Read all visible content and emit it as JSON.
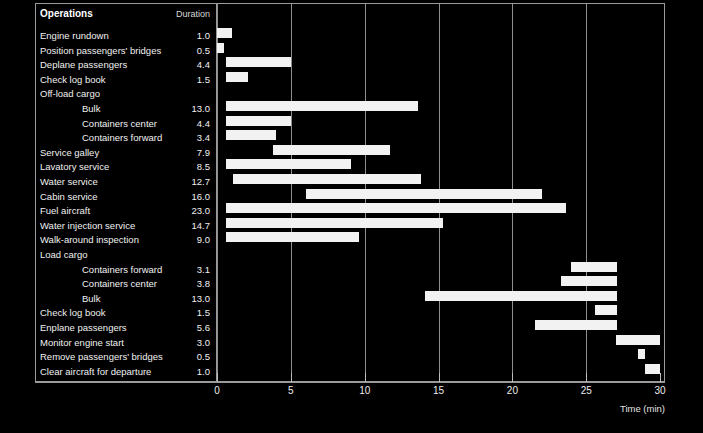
{
  "chart_data": {
    "type": "bar",
    "subtype": "gantt",
    "title": "",
    "xlabel": "Time (min)",
    "ylabel": "",
    "xlim": [
      0,
      30
    ],
    "xticks": [
      0,
      5,
      10,
      15,
      20,
      25,
      30
    ],
    "grid": "vertical",
    "legend": "none",
    "columns": [
      "Operations",
      "Duration"
    ],
    "bar_color": "#f2f2f2",
    "background_color": "#000000",
    "frame_color": "#9a9a9a",
    "tasks": [
      {
        "label": "Engine rundown",
        "indent": 0,
        "duration": "1.0",
        "start": 0.0,
        "length": 1.0,
        "has_bar": true
      },
      {
        "label": "Position passengers' bridges",
        "indent": 0,
        "duration": "0.5",
        "start": 0.0,
        "length": 0.5,
        "has_bar": true
      },
      {
        "label": "Deplane passengers",
        "indent": 0,
        "duration": "4.4",
        "start": 0.6,
        "length": 4.4,
        "has_bar": true
      },
      {
        "label": "Check log book",
        "indent": 0,
        "duration": "1.5",
        "start": 0.6,
        "length": 1.5,
        "has_bar": true
      },
      {
        "label": "Off-load cargo",
        "indent": 0,
        "duration": "",
        "start": 0.0,
        "length": 0.0,
        "has_bar": false
      },
      {
        "label": "Bulk",
        "indent": 1,
        "duration": "13.0",
        "start": 0.6,
        "length": 13.0,
        "has_bar": true
      },
      {
        "label": "Containers center",
        "indent": 1,
        "duration": "4.4",
        "start": 0.6,
        "length": 4.4,
        "has_bar": true
      },
      {
        "label": "Containers forward",
        "indent": 1,
        "duration": "3.4",
        "start": 0.6,
        "length": 3.4,
        "has_bar": true
      },
      {
        "label": "Service galley",
        "indent": 0,
        "duration": "7.9",
        "start": 3.8,
        "length": 7.9,
        "has_bar": true
      },
      {
        "label": "Lavatory service",
        "indent": 0,
        "duration": "8.5",
        "start": 0.6,
        "length": 8.5,
        "has_bar": true
      },
      {
        "label": "Water service",
        "indent": 0,
        "duration": "12.7",
        "start": 1.1,
        "length": 12.7,
        "has_bar": true
      },
      {
        "label": "Cabin service",
        "indent": 0,
        "duration": "16.0",
        "start": 6.0,
        "length": 16.0,
        "has_bar": true
      },
      {
        "label": "Fuel aircraft",
        "indent": 0,
        "duration": "23.0",
        "start": 0.6,
        "length": 23.0,
        "has_bar": true
      },
      {
        "label": "Water injection service",
        "indent": 0,
        "duration": "14.7",
        "start": 0.6,
        "length": 14.7,
        "has_bar": true
      },
      {
        "label": "Walk-around inspection",
        "indent": 0,
        "duration": "9.0",
        "start": 0.6,
        "length": 9.0,
        "has_bar": true
      },
      {
        "label": "Load cargo",
        "indent": 0,
        "duration": "",
        "start": 0.0,
        "length": 0.0,
        "has_bar": false
      },
      {
        "label": "Containers forward",
        "indent": 1,
        "duration": "3.1",
        "start": 24.0,
        "length": 3.1,
        "has_bar": true
      },
      {
        "label": "Containers center",
        "indent": 1,
        "duration": "3.8",
        "start": 23.3,
        "length": 3.8,
        "has_bar": true
      },
      {
        "label": "Bulk",
        "indent": 1,
        "duration": "13.0",
        "start": 14.1,
        "length": 13.0,
        "has_bar": true
      },
      {
        "label": "Check log book",
        "indent": 0,
        "duration": "1.5",
        "start": 25.6,
        "length": 1.5,
        "has_bar": true
      },
      {
        "label": "Enplane passengers",
        "indent": 0,
        "duration": "5.6",
        "start": 21.5,
        "length": 5.6,
        "has_bar": true
      },
      {
        "label": "Monitor engine start",
        "indent": 0,
        "duration": "3.0",
        "start": 27.0,
        "length": 3.0,
        "has_bar": true
      },
      {
        "label": "Remove passengers' bridges",
        "indent": 0,
        "duration": "0.5",
        "start": 28.5,
        "length": 0.5,
        "has_bar": true
      },
      {
        "label": "Clear aircraft for departure",
        "indent": 0,
        "duration": "1.0",
        "start": 29.0,
        "length": 1.0,
        "has_bar": true
      }
    ]
  },
  "header": {
    "operations_label": "Operations",
    "duration_label": "Duration"
  },
  "axis": {
    "title": "Time (min)",
    "tick_labels": [
      "0",
      "5",
      "10",
      "15",
      "20",
      "25",
      "30"
    ]
  }
}
